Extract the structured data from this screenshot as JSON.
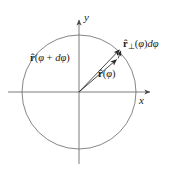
{
  "figure": {
    "width": 176,
    "height": 171,
    "background": "#ffffff",
    "stroke_color": "#6b6b6b",
    "text_color": "#1a1a1a",
    "caption": "Unit circle showing radial unit vector r-hat at angle phi and at angle phi plus d-phi, with their difference equal to the perpendicular unit vector times d-phi"
  },
  "axes": {
    "origin": {
      "x": 79,
      "y": 92
    },
    "x_axis": {
      "label": "x",
      "start_x": 8,
      "end_x": 152,
      "y": 92,
      "arrow": "right"
    },
    "y_axis": {
      "label": "y",
      "x": 79,
      "start_y": 162,
      "end_y": 18,
      "arrow": "up"
    }
  },
  "circle": {
    "center_x": 79,
    "center_y": 92,
    "radius": 57,
    "stroke": "#6b6b6b",
    "stroke_width": 0.9,
    "fill": "none"
  },
  "vectors": [
    {
      "name": "r-hat-phi-plus-dphi",
      "label_html": "<span class=\"rhat\">r&#770;</span><span class=\"paren\">(</span>&#966;<span class=\"op\"> + </span>d&#966;<span class=\"paren\">)</span>",
      "label_text": "r̂(φ + dφ)",
      "from_x": 79,
      "from_y": 92,
      "to_x": 121,
      "to_y": 48,
      "angle_deg": 46.3
    },
    {
      "name": "r-hat-phi",
      "label_html": "<span class=\"rhat\">r&#770;</span><span class=\"paren\">(</span>&#966;<span class=\"paren\">)</span>",
      "label_text": "r̂(φ)",
      "from_x": 79,
      "from_y": 92,
      "to_x": 118,
      "to_y": 58,
      "angle_deg": 41.1
    },
    {
      "name": "r-hat-perp-phi-dphi",
      "label_html": "<span class=\"rhat\">r&#770;</span><span class=\"perp\">&#8869;</span><span class=\"paren\">(</span>&#966;<span class=\"paren\">)</span>d&#966;",
      "label_text": "r̂⊥(φ)dφ",
      "from_x": 118,
      "from_y": 58,
      "to_x": 121.5,
      "to_y": 48.5,
      "angle_deg": 69.8
    }
  ]
}
